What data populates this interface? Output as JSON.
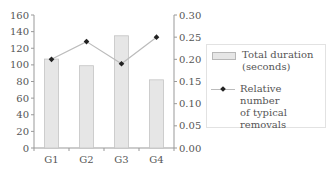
{
  "chart_data": {
    "type": "bar",
    "title": "",
    "xlabel": "",
    "ylabel": "",
    "categories": [
      "G1",
      "G2",
      "G3",
      "G4"
    ],
    "series": [
      {
        "name": "Total duration (seconds)",
        "type": "bar",
        "axis": "left",
        "values": [
          107,
          99,
          135,
          82
        ],
        "color": "#e6e6e6"
      },
      {
        "name": "Relative number of typical removals",
        "type": "line",
        "axis": "right",
        "values": [
          0.2,
          0.24,
          0.19,
          0.25
        ],
        "color": "#bbbbbb",
        "marker_color": "#222222"
      }
    ],
    "ylim": [
      0,
      160
    ],
    "y2lim": [
      0,
      0.3
    ],
    "yticks": [
      "0",
      "20",
      "40",
      "60",
      "80",
      "100",
      "120",
      "140",
      "160"
    ],
    "y2ticks": [
      "0.00",
      "0.05",
      "0.10",
      "0.15",
      "0.20",
      "0.25",
      "0.30"
    ],
    "grid": false,
    "legend_position": "right"
  },
  "legend": {
    "bar_label_1": "Total duration",
    "bar_label_2": "(seconds)",
    "line_label_1": "Relative number",
    "line_label_2": "of typical",
    "line_label_3": "removals"
  }
}
